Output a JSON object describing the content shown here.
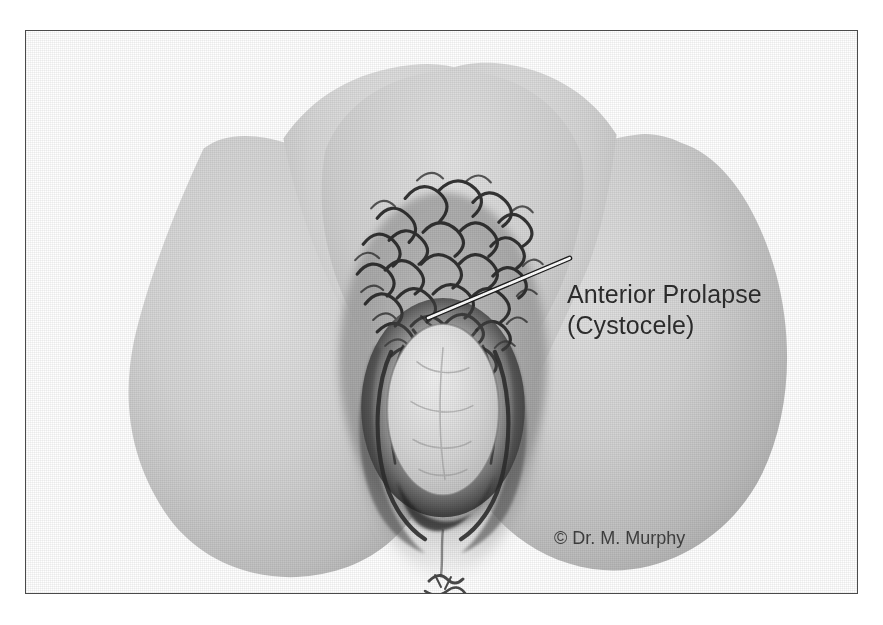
{
  "figure": {
    "kind": "medical-illustration",
    "view": "lithotomy-perineal-view",
    "frame": {
      "border_color": "#4a4a4a",
      "background_color": "#ffffff"
    },
    "annotation": {
      "line1": "Anterior Prolapse",
      "line2": "(Cystocele)",
      "text_color": "#2b2b2b",
      "leader_line_color": "#ffffff",
      "leader_line_outline_color": "#1c1c1c"
    },
    "copyright": {
      "text": "© Dr. M. Murphy",
      "text_color": "#3d3d3d"
    },
    "palette": {
      "skin_light": "#dcdcdc",
      "skin_mid": "#c7c7c7",
      "skin_shadow": "#a9a9a9",
      "skin_deep_shadow": "#8d8d8d",
      "cleft_dark": "#6e6e6e",
      "hair_dark": "#2a2a2a",
      "introitus_dark": "#3a3a3a",
      "prolapse_highlight": "#e9e9e9",
      "prolapse_mid": "#d2d2d2"
    },
    "structures": [
      {
        "name": "left-buttock",
        "label": "Left buttock / thigh"
      },
      {
        "name": "right-buttock",
        "label": "Right buttock / thigh"
      },
      {
        "name": "mons-pubis",
        "label": "Mons pubis"
      },
      {
        "name": "pubic-hair",
        "label": "Pubic hair"
      },
      {
        "name": "labia-majora",
        "label": "Labia majora"
      },
      {
        "name": "labia-minora",
        "label": "Labia minora"
      },
      {
        "name": "prolapse-bulge",
        "label": "Anterior vaginal wall bulge (cystocele)"
      },
      {
        "name": "perineum",
        "label": "Perineal body"
      },
      {
        "name": "anus",
        "label": "Anus"
      }
    ]
  }
}
